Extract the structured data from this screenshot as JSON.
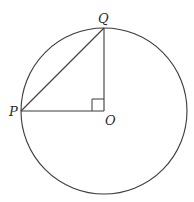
{
  "diagram": {
    "type": "geometry",
    "stroke_color": "#3a3a3a",
    "background": "#ffffff",
    "circle": {
      "cx": 104,
      "cy": 111,
      "r": 83
    },
    "points": {
      "P": {
        "label": "P",
        "x": 21,
        "y": 111
      },
      "Q": {
        "label": "Q",
        "x": 104,
        "y": 28
      },
      "O": {
        "label": "O",
        "x": 104,
        "y": 111
      }
    },
    "segments": [
      {
        "from": "P",
        "to": "Q"
      },
      {
        "from": "Q",
        "to": "O"
      },
      {
        "from": "P",
        "to": "O"
      }
    ],
    "right_angle_marker": {
      "at": "O",
      "size": 12
    }
  }
}
